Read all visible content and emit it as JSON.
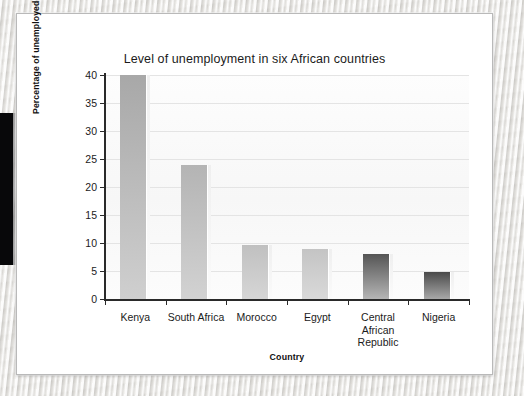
{
  "figure": {
    "title": "Level of unemployment in six African countries"
  },
  "chart_data": {
    "type": "bar",
    "title": "Level of unemployment in six African countries",
    "xlabel": "Country",
    "ylabel": "Percentage of unemployed",
    "categories": [
      "Kenya",
      "South Africa",
      "Morocco",
      "Egypt",
      "Central African Republic",
      "Nigeria"
    ],
    "category_lines": [
      [
        "Kenya"
      ],
      [
        "South Africa"
      ],
      [
        "Morocco"
      ],
      [
        "Egypt"
      ],
      [
        "Central",
        "African",
        "Republic"
      ],
      [
        "Nigeria"
      ]
    ],
    "values": [
      40,
      24,
      9.7,
      9,
      8,
      4.9
    ],
    "ylim": [
      0,
      40
    ],
    "yticks": [
      0,
      5,
      10,
      15,
      20,
      25,
      30,
      35,
      40
    ],
    "ytick_labels": [
      "0",
      "5",
      "10",
      "15",
      "20",
      "25",
      "30",
      "35",
      "40"
    ],
    "grid": true,
    "grid_axis": "y",
    "legend": false,
    "bar_colors": [
      "#a8a8a8",
      "#b4b4b4",
      "#c0c0c0",
      "#c4c4c4",
      "#555555",
      "#4a4a4a"
    ],
    "bar_colors_bottom": [
      "#cfcfcf",
      "#d2d2d2",
      "#d6d6d6",
      "#d9d9d9",
      "#b5b5b5",
      "#a8a8a8"
    ]
  },
  "colors": {
    "axis": "#2a2a2a",
    "grid": "#e4e4e4",
    "text": "#1b1b1b",
    "page": "#ffffff",
    "surface": "#e8e7e4"
  }
}
